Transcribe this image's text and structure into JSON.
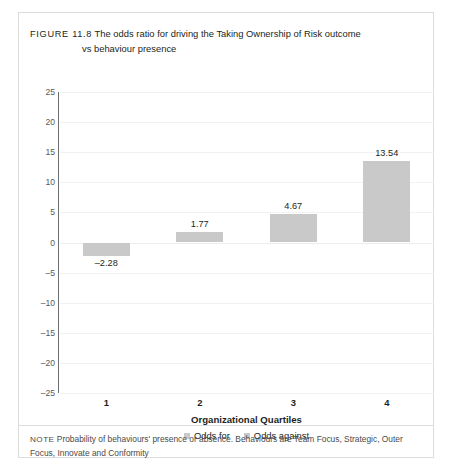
{
  "figure": {
    "number_label": "FIGURE 11.8",
    "caption_line1": "The odds ratio for driving the Taking Ownership of Risk outcome",
    "caption_line2": "vs behaviour presence",
    "note_tag": "NOTE",
    "note_text": "Probability of behaviours' presence or absence. Behaviours are Team Focus, Strategic, Outer Focus, Innovate and Conformity"
  },
  "chart_data": {
    "type": "bar",
    "title": "The odds ratio for driving the Taking Ownership of Risk outcome vs behaviour presence",
    "xlabel": "Organizational Quartiles",
    "ylabel": "",
    "categories": [
      "1",
      "2",
      "3",
      "4"
    ],
    "values": [
      -2.28,
      1.77,
      4.67,
      13.54
    ],
    "data_labels": [
      "–2.28",
      "1.77",
      "4.67",
      "13.54"
    ],
    "ylim": [
      -25,
      25
    ],
    "ytick_step": 5,
    "yticks": [
      "25",
      "20",
      "15",
      "10",
      "5",
      "0",
      "–5",
      "–10",
      "–15",
      "–20",
      "–25"
    ],
    "ytick_values": [
      25,
      20,
      15,
      10,
      5,
      0,
      -5,
      -10,
      -15,
      -20,
      -25
    ],
    "grid": true,
    "legend_position": "bottom",
    "legend": [
      {
        "label": "Odds for",
        "color": "#c9c9c9"
      },
      {
        "label": "Odds against",
        "color": "#c9c9c9"
      }
    ],
    "bar_color": "#c9c9c9",
    "axis_color": "#6d6e71"
  }
}
